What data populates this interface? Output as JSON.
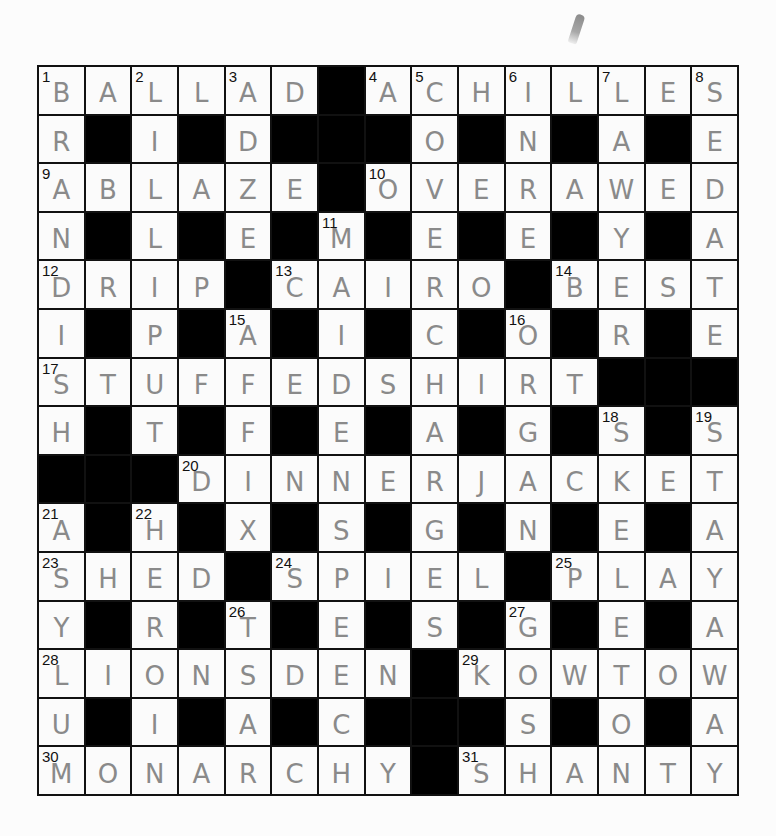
{
  "puzzle": {
    "rows": 15,
    "cols": 15,
    "grid": [
      "BALLAD#ACHILLES",
      "R#I#D###O#N#A#E",
      "ABLAZE#OVERAWED",
      "N#L#E#M#E#E#Y#A",
      "DRIP#CAIRO#BEST",
      "I#P#A#I#C#O#R#E",
      "STUFFEDSHIRT###",
      "H#T#F#E#A#G#S#S",
      "###DINNERJACKET",
      "A#H#X#S#G#N#E#A",
      "SHED#SPIEL#PLAY",
      "Y#R#T#E#S#G#E#A",
      "LIONSDEN#KOWTOW",
      "U#I#A#C###S#O#A",
      "MONARCHY#SHANTY"
    ],
    "numbers": [
      {
        "n": 1,
        "r": 0,
        "c": 0
      },
      {
        "n": 2,
        "r": 0,
        "c": 2
      },
      {
        "n": 3,
        "r": 0,
        "c": 4
      },
      {
        "n": 4,
        "r": 0,
        "c": 7
      },
      {
        "n": 5,
        "r": 0,
        "c": 8
      },
      {
        "n": 6,
        "r": 0,
        "c": 10
      },
      {
        "n": 7,
        "r": 0,
        "c": 12
      },
      {
        "n": 8,
        "r": 0,
        "c": 14
      },
      {
        "n": 9,
        "r": 2,
        "c": 0
      },
      {
        "n": 10,
        "r": 2,
        "c": 7
      },
      {
        "n": 11,
        "r": 3,
        "c": 6
      },
      {
        "n": 12,
        "r": 4,
        "c": 0
      },
      {
        "n": 13,
        "r": 4,
        "c": 5
      },
      {
        "n": 14,
        "r": 4,
        "c": 11
      },
      {
        "n": 15,
        "r": 5,
        "c": 4
      },
      {
        "n": 16,
        "r": 5,
        "c": 10
      },
      {
        "n": 17,
        "r": 6,
        "c": 0
      },
      {
        "n": 18,
        "r": 7,
        "c": 12
      },
      {
        "n": 19,
        "r": 7,
        "c": 14
      },
      {
        "n": 20,
        "r": 8,
        "c": 3
      },
      {
        "n": 21,
        "r": 9,
        "c": 0
      },
      {
        "n": 22,
        "r": 9,
        "c": 2
      },
      {
        "n": 23,
        "r": 10,
        "c": 0
      },
      {
        "n": 24,
        "r": 10,
        "c": 5
      },
      {
        "n": 25,
        "r": 10,
        "c": 11
      },
      {
        "n": 26,
        "r": 11,
        "c": 4
      },
      {
        "n": 27,
        "r": 11,
        "c": 10
      },
      {
        "n": 28,
        "r": 12,
        "c": 0
      },
      {
        "n": 29,
        "r": 12,
        "c": 9
      },
      {
        "n": 30,
        "r": 14,
        "c": 0
      },
      {
        "n": 31,
        "r": 14,
        "c": 9
      }
    ],
    "answers_across": [
      {
        "n": 1,
        "word": "BALLAD"
      },
      {
        "n": 4,
        "word": "ACHILLES"
      },
      {
        "n": 9,
        "word": "ABLAZE"
      },
      {
        "n": 10,
        "word": "OVERAWED"
      },
      {
        "n": 12,
        "word": "DRIP"
      },
      {
        "n": 13,
        "word": "CAIRO"
      },
      {
        "n": 14,
        "word": "BEST"
      },
      {
        "n": 17,
        "word": "STUFFEDSHIRT"
      },
      {
        "n": 20,
        "word": "DINNERJACKET"
      },
      {
        "n": 23,
        "word": "SHED"
      },
      {
        "n": 24,
        "word": "SPIEL"
      },
      {
        "n": 25,
        "word": "PLAY"
      },
      {
        "n": 28,
        "word": "LIONSDEN"
      },
      {
        "n": 29,
        "word": "KOWTOW"
      },
      {
        "n": 30,
        "word": "MONARCHY"
      },
      {
        "n": 31,
        "word": "SHANTY"
      }
    ],
    "answers_down": [
      {
        "n": 1,
        "word": "BRANDISH"
      },
      {
        "n": 2,
        "word": "LILLIPUT"
      },
      {
        "n": 3,
        "word": "ADZE"
      },
      {
        "n": 5,
        "word": "COVERCHARGES"
      },
      {
        "n": 6,
        "word": "INRE"
      },
      {
        "n": 7,
        "word": "LAYER"
      },
      {
        "n": 8,
        "word": "SEDATE"
      },
      {
        "n": 11,
        "word": "MAIDENSPEECH"
      },
      {
        "n": 15,
        "word": "AFFIX"
      },
      {
        "n": 16,
        "word": "ORGAN"
      },
      {
        "n": 18,
        "word": "SKEPTIC"
      },
      {
        "n": 19,
        "word": "STAYAWAY"
      },
      {
        "n": 21,
        "word": "ASYLUM"
      },
      {
        "n": 22,
        "word": "HEROIN"
      },
      {
        "n": 26,
        "word": "TSAR"
      },
      {
        "n": 27,
        "word": "GOSH"
      }
    ]
  }
}
